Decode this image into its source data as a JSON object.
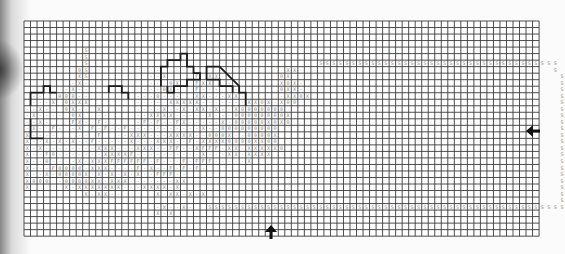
{
  "document": {
    "type": "chart-grid",
    "description": "Scanned cross-stitch / knitting chart on graph grid",
    "grid": {
      "origin_x": 24,
      "origin_y": 21,
      "cell": 6.52,
      "cols": 79,
      "rows": 33,
      "line_color": "#3a3a3a",
      "background": "#ffffff"
    },
    "symbol_color": "#8a8a8a",
    "outline_color": "#1a1a1a",
    "legend_symbols": [
      "-",
      "0",
      "X",
      "F",
      "S",
      "Y",
      "E"
    ],
    "rows": [
      "",
      "",
      "",
      "",
      "         S",
      "         S",
      "         S                                   SSSSSSSSSSSSSSSSSSSSSSSSSSSSSSSSSSSSS",
      "        0S          -                   XX                                       S",
      "        XS         --X    F XX         0X                                         S",
      "       -X--        -- 0X  FXX  -       X0X-                                       S",
      "      -X--        ---0X-  F---  -      0XX-                                       S",
      " --  000--       ---0---  XX---XX-     -XX0X                                      S",
      " ---X 0XXX       -----XXXXX-------XX0X-X00                                        S",
      "--X-- 0X-- X     ----X--X-XX-X--X0000000                                          S",
      "-X---- 0X  --    --XXXX-----X---00000000X                                         S",
      "--X-   FX--F-    -F-F--FX-----X-00000X0X0                                         S",
      "-X- F- -X F-F--F-----------X--000000000                                           S",
      "X----   -- F  --XXX---XXXX--000X--0000X                                           S",
      "X--X-X-X--F-----X---XXX--F-XXXX0000XX00                                           S",
      "X-X--------XXX---XXX--FF--XFFF-XX-XXXXX0                                          S",
      "X--F0-------XXXXF----------X---XX-XXXX                                            S",
      "X--0----X-XXXFFFFFF-F---F-FFF-----X                                               S",
      "X---F0000-XXX----F-X--F-F-F-                                                      S",
      "X--X-0000X-X-X-X-X--FFF--                                                         S",
      "X000 -0000XX-XXX-------XX                                                         S",
      "X     X-XXXXXXX---XXXX-X                                                          S",
      "         X-XX--     X-XX-X-X                                                      S",
      "                                                                                  S",
      "                    -X--X-  SSSSSSSSSSSSSSSSSSSSSSSSSSSSSSSSSSSSSSSSSSSSSSSSSSSSSSS",
      "                    X-X",
      "",
      "",
      ""
    ],
    "outlines": [
      {
        "name": "left-block-outline",
        "points": [
          [
            1,
            13
          ],
          [
            1,
            11
          ],
          [
            3,
            11
          ],
          [
            3,
            10
          ],
          [
            4,
            10
          ],
          [
            4,
            11
          ],
          [
            5,
            11
          ]
        ]
      },
      {
        "name": "left-lower-outline",
        "points": [
          [
            1,
            15
          ],
          [
            1,
            18
          ],
          [
            3,
            18
          ]
        ]
      },
      {
        "name": "mid-step-outline",
        "points": [
          [
            13,
            11
          ],
          [
            13,
            10
          ],
          [
            15,
            10
          ],
          [
            15,
            11
          ],
          [
            16,
            11
          ],
          [
            16,
            12
          ]
        ]
      },
      {
        "name": "tower-outline",
        "points": [
          [
            21,
            10
          ],
          [
            21,
            7
          ],
          [
            22,
            7
          ],
          [
            22,
            6
          ],
          [
            24,
            6
          ],
          [
            24,
            5
          ],
          [
            25,
            5
          ],
          [
            25,
            7
          ],
          [
            26,
            7
          ],
          [
            26,
            8
          ],
          [
            27,
            8
          ],
          [
            27,
            9
          ],
          [
            25,
            9
          ],
          [
            25,
            10
          ],
          [
            23,
            10
          ],
          [
            23,
            11
          ],
          [
            22,
            11
          ],
          [
            22,
            10
          ]
        ]
      },
      {
        "name": "roof-outline",
        "points": [
          [
            28,
            9
          ],
          [
            28,
            7
          ],
          [
            30,
            7
          ],
          [
            33,
            10
          ],
          [
            33,
            11
          ],
          [
            34,
            11
          ],
          [
            34,
            13
          ]
        ]
      },
      {
        "name": "roof-inner-outline",
        "points": [
          [
            28,
            9
          ],
          [
            30,
            9
          ],
          [
            30,
            10
          ],
          [
            32,
            10
          ],
          [
            32,
            11
          ]
        ]
      }
    ],
    "markers": [
      {
        "name": "right-center-arrow",
        "direction": "left",
        "x": 532,
        "y": 131
      },
      {
        "name": "bottom-center-arrow",
        "direction": "up",
        "x": 271,
        "y": 231
      }
    ]
  }
}
